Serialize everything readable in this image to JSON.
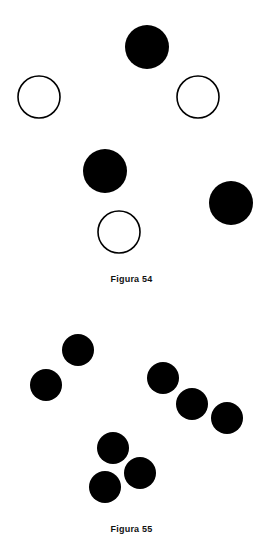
{
  "figure54": {
    "caption": "Figura 54",
    "circles": [
      {
        "cx": 147,
        "cy": 47,
        "r": 22,
        "fill": "filled"
      },
      {
        "cx": 39,
        "cy": 97,
        "r": 21,
        "fill": "open"
      },
      {
        "cx": 198,
        "cy": 97,
        "r": 21,
        "fill": "open"
      },
      {
        "cx": 105,
        "cy": 171,
        "r": 22,
        "fill": "filled"
      },
      {
        "cx": 231,
        "cy": 203,
        "r": 22,
        "fill": "filled"
      },
      {
        "cx": 119,
        "cy": 232,
        "r": 21,
        "fill": "open"
      }
    ]
  },
  "figure55": {
    "caption": "Figura 55",
    "circles": [
      {
        "cx": 78,
        "cy": 350,
        "r": 16
      },
      {
        "cx": 46,
        "cy": 385,
        "r": 16
      },
      {
        "cx": 163,
        "cy": 378,
        "r": 16
      },
      {
        "cx": 192,
        "cy": 404,
        "r": 16
      },
      {
        "cx": 227,
        "cy": 418,
        "r": 16
      },
      {
        "cx": 113,
        "cy": 448,
        "r": 16
      },
      {
        "cx": 140,
        "cy": 473,
        "r": 16
      },
      {
        "cx": 105,
        "cy": 487,
        "r": 16
      }
    ]
  },
  "colors": {
    "ink": "#000000",
    "paper": "#ffffff"
  }
}
